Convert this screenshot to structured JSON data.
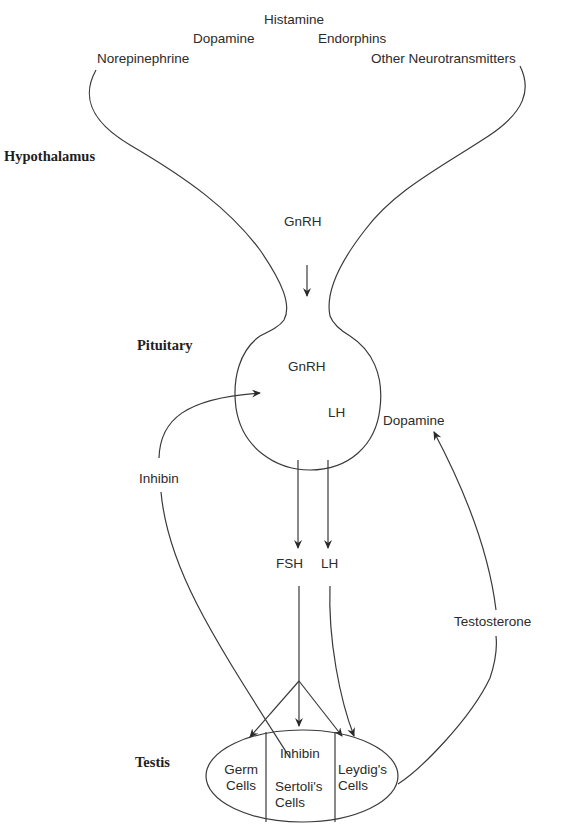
{
  "regions": {
    "hypothalamus": "Hypothalamus",
    "pituitary": "Pituitary",
    "testis": "Testis"
  },
  "neurotransmitters": {
    "histamine": "Histamine",
    "dopamine": "Dopamine",
    "endorphins": "Endorphins",
    "norepinephrine": "Norepinephrine",
    "other": "Other Neurotransmitters"
  },
  "hormones": {
    "gnrh_hypothalamus": "GnRH",
    "gnrh_pituitary": "GnRH",
    "lh_pituitary": "LH",
    "dopamine_feedback": "Dopamine",
    "inhibin_feedback": "Inhibin",
    "fsh": "FSH",
    "lh": "LH",
    "testosterone": "Testosterone",
    "inhibin_sertoli": "Inhibin"
  },
  "testis_cells": {
    "germ_line1": "Germ",
    "germ_line2": "Cells",
    "sertoli_line1": "Sertoli's",
    "sertoli_line2": "Cells",
    "leydig_line1": "Leydig's",
    "leydig_line2": "Cells"
  },
  "colors": {
    "stroke": "#3a3a3a",
    "text": "#2b2b2b",
    "background": "#ffffff"
  }
}
